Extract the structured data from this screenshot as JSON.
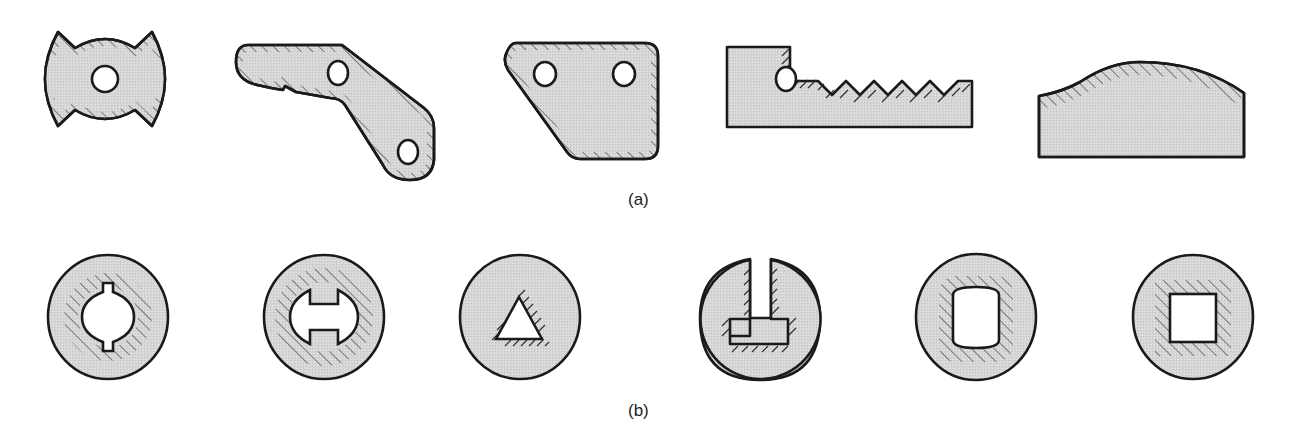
{
  "figure": {
    "captions": {
      "a": "(a)",
      "b": "(b)"
    },
    "colors": {
      "fill": "#d9d9d9",
      "stroke": "#1a1a1a",
      "background": "#ffffff"
    },
    "row_a": {
      "description": "Flat blank profiles with hatched edges indicating sheared/cut surfaces",
      "shapes": [
        {
          "id": "a1",
          "name": "double-notched round blank with center hole",
          "holes": 1
        },
        {
          "id": "a2",
          "name": "bent link lever with two holes",
          "holes": 2
        },
        {
          "id": "a3",
          "name": "trapezoidal plate with two holes",
          "holes": 2
        },
        {
          "id": "a4",
          "name": "serrated rack bar with one hole",
          "holes": 1,
          "teeth": 5
        },
        {
          "id": "a5",
          "name": "block with curved contoured top",
          "holes": 0
        }
      ]
    },
    "row_b": {
      "description": "Circular blanks with internal punched profiles, hatching marks cut edges",
      "shapes": [
        {
          "id": "b1",
          "name": "circle with keyed round bore"
        },
        {
          "id": "b2",
          "name": "circle with double-D slotted bore"
        },
        {
          "id": "b3",
          "name": "circle with triangular hole"
        },
        {
          "id": "b4",
          "name": "circle with inverted T slot open at top"
        },
        {
          "id": "b5",
          "name": "circle with rounded-rectangle hole"
        },
        {
          "id": "b6",
          "name": "circle with square hole"
        }
      ]
    }
  }
}
